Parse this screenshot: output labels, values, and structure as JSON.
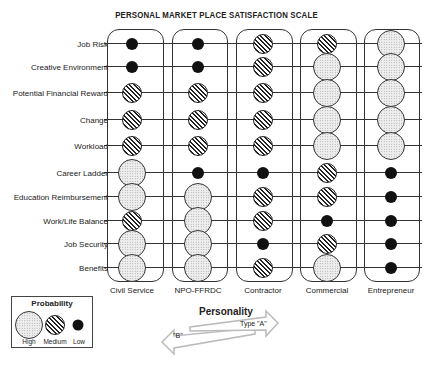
{
  "title": "PERSONAL MARKET PLACE SATISFACTION SCALE",
  "rows": [
    "Job Risk",
    "Creative Environment",
    "Potential Financial Reward",
    "Change",
    "Workload",
    "Career Ladder",
    "Education Reimbursement",
    "Work/Life Balance",
    "Job Security",
    "Benefits"
  ],
  "columns": [
    "Civil Service",
    "NPO-FFRDC",
    "Contractor",
    "Commercial",
    "Entrepreneur"
  ],
  "ratings": {
    "Civil Service": [
      "Low",
      "Low",
      "Medium",
      "Medium",
      "Medium",
      "High",
      "High",
      "Medium",
      "High",
      "High"
    ],
    "NPO-FFRDC": [
      "Low",
      "Low",
      "Medium",
      "Medium",
      "Medium",
      "Low",
      "High",
      "High",
      "High",
      "High"
    ],
    "Contractor": [
      "Medium",
      "Medium",
      "Medium",
      "Medium",
      "Medium",
      "Low",
      "Medium",
      "Medium",
      "Low",
      "Medium"
    ],
    "Commercial": [
      "Medium",
      "High",
      "High",
      "High",
      "High",
      "Medium",
      "Medium",
      "Low",
      "Medium",
      "High"
    ],
    "Entrepreneur": [
      "High",
      "High",
      "High",
      "High",
      "High",
      "Low",
      "Low",
      "Low",
      "Low",
      "Low"
    ]
  },
  "legend": {
    "title": "Probability",
    "items": [
      "High",
      "Medium",
      "Low"
    ]
  },
  "personality": {
    "title": "Personality",
    "left_label": "\"B\"",
    "right_label": "Type \"A\""
  }
}
